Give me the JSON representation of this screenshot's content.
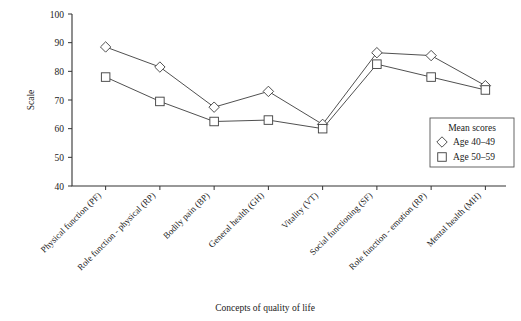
{
  "chart_data": {
    "type": "line",
    "title": "",
    "xlabel": "Concepts of quality of life",
    "ylabel": "Scale",
    "ylim": [
      40,
      100
    ],
    "yticks": [
      40,
      50,
      60,
      70,
      80,
      90,
      100
    ],
    "ytick_labels": [
      "40",
      "50",
      "60",
      "70",
      "80",
      "90",
      "100"
    ],
    "grid": false,
    "legend_position": "lower-right",
    "legend_title": "Mean scores",
    "categories": [
      "Physical function (PF)",
      "Role function - physical (RP)",
      "Bodily pain (BP)",
      "General health (GH)",
      "Vitality (VT)",
      "Social functioning (SF)",
      "Role function - emotion (RP)",
      "Mental health (MH)"
    ],
    "series": [
      {
        "name": "Age 40–49",
        "marker": "diamond",
        "values": [
          88.5,
          81.5,
          67.5,
          73.0,
          61.5,
          86.5,
          85.5,
          75.0
        ]
      },
      {
        "name": "Age 50–59",
        "marker": "square",
        "values": [
          78.0,
          69.5,
          62.5,
          63.0,
          60.0,
          82.5,
          78.0,
          73.5
        ]
      }
    ]
  },
  "legend": {
    "title": "Mean scores",
    "entries": [
      {
        "marker": "diamond-marker",
        "label": "Age 40–49"
      },
      {
        "marker": "square-marker",
        "label": "Age 50–59"
      }
    ]
  }
}
